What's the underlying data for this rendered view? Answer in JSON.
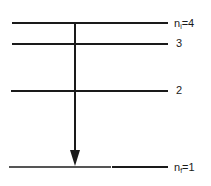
{
  "diagram": {
    "type": "energy-level-diagram",
    "levels": [
      {
        "n": 4,
        "label": "n",
        "subscript": "i",
        "suffix": "=4",
        "y": 22
      },
      {
        "n": 3,
        "label": "3",
        "y": 43
      },
      {
        "n": 2,
        "label": "2",
        "y": 90
      },
      {
        "n": 1,
        "label": "n",
        "subscript": "f",
        "suffix": "=1",
        "y": 166
      }
    ],
    "transition": {
      "from": 4,
      "to": 1,
      "direction": "down",
      "x": 75
    }
  }
}
